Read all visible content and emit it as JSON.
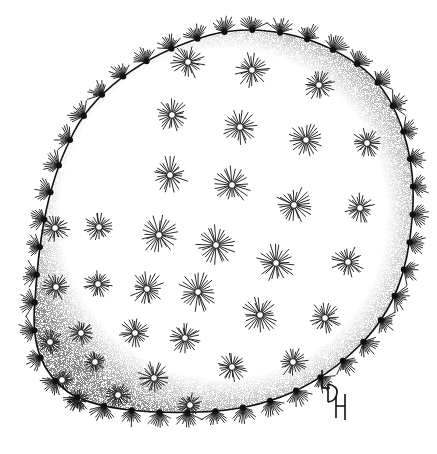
{
  "image": {
    "subject": "Prickly pear cactus pad (Opuntia) botanical pen-and-ink illustration",
    "style": "black ink stipple and line drawing on white",
    "ink_color": "#111111",
    "background_color": "#ffffff",
    "signature_monogram": "LDH",
    "areole_count_estimate": 60
  }
}
